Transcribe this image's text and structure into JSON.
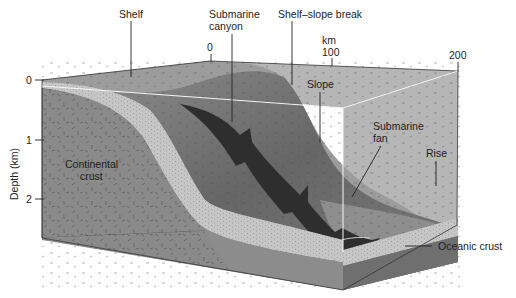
{
  "figure": {
    "type": "block-diagram"
  },
  "labels": {
    "shelf": "Shelf",
    "submarine_canyon_line1": "Submarine",
    "submarine_canyon_line2": "canyon",
    "shelf_slope_break": "Shelf–slope break",
    "slope": "Slope",
    "submarine_fan_line1": "Submarine",
    "submarine_fan_line2": "fan",
    "rise": "Rise",
    "continental_crust_line1": "Continental",
    "continental_crust_line2": "crust",
    "oceanic_crust": "Oceanic crust"
  },
  "axes": {
    "depth": {
      "title": "Depth (km)",
      "ticks": [
        "0",
        "1",
        "2"
      ]
    },
    "distance": {
      "unit": "km",
      "ticks": [
        "0",
        "100",
        "200"
      ]
    }
  },
  "colors": {
    "shelf_surface": "#9a9a9a",
    "slope_surface": "#6e6e6e",
    "canyon": "#2e2e2e",
    "rise_surface": "#8c8c8c",
    "sediment": "#c4c4c4",
    "continental_crust": "#8a8a8a",
    "oceanic_crust": "#7a7a7a",
    "water": "#b8b8b8",
    "glass_edge": "#f2f2f2"
  }
}
